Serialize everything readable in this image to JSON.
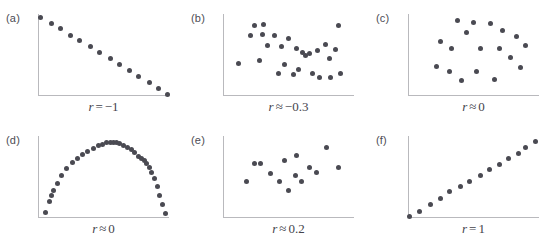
{
  "figure": {
    "type": "multi-panel-scatter",
    "background_color": "#ffffff",
    "dot_color": "#4a4a52",
    "axis_color": "#b9b9bd",
    "caption_color": "#44444c",
    "panel_count": 6,
    "columns": 3,
    "rows": 2
  },
  "chart_data": [
    {
      "type": "scatter",
      "panel": "a",
      "tag": "(a)",
      "title": "",
      "caption": "r = −1",
      "caption_symbol": "r",
      "caption_relation": "=",
      "caption_value": "−1",
      "xlabel": "",
      "ylabel": "",
      "xlim": [
        0,
        1
      ],
      "ylim": [
        0,
        1
      ],
      "grid": false,
      "legend": null,
      "n_points": 14,
      "x": [
        0.02,
        0.1,
        0.17,
        0.25,
        0.32,
        0.4,
        0.47,
        0.55,
        0.62,
        0.7,
        0.77,
        0.85,
        0.92,
        0.99
      ],
      "y": [
        0.96,
        0.89,
        0.82,
        0.74,
        0.68,
        0.6,
        0.53,
        0.46,
        0.39,
        0.31,
        0.24,
        0.17,
        0.09,
        0.02
      ]
    },
    {
      "type": "scatter",
      "panel": "b",
      "tag": "(b)",
      "title": "",
      "caption": "r ≈ −0.3",
      "caption_symbol": "r",
      "caption_relation": "≈",
      "caption_value": "−0.3",
      "xlabel": "",
      "ylabel": "",
      "xlim": [
        0,
        1
      ],
      "ylim": [
        0,
        1
      ],
      "grid": false,
      "legend": null,
      "n_points": 27,
      "x": [
        0.24,
        0.31,
        0.21,
        0.3,
        0.39,
        0.5,
        0.34,
        0.45,
        0.56,
        0.61,
        0.63,
        0.66,
        0.72,
        0.78,
        0.81,
        0.86,
        0.88,
        0.12,
        0.28,
        0.42,
        0.47,
        0.54,
        0.58,
        0.68,
        0.74,
        0.82,
        0.9
      ],
      "y": [
        0.86,
        0.87,
        0.74,
        0.75,
        0.74,
        0.7,
        0.62,
        0.6,
        0.58,
        0.53,
        0.5,
        0.52,
        0.55,
        0.63,
        0.46,
        0.57,
        0.86,
        0.4,
        0.43,
        0.28,
        0.38,
        0.26,
        0.32,
        0.27,
        0.22,
        0.23,
        0.28
      ]
    },
    {
      "type": "scatter",
      "panel": "c",
      "tag": "(c)",
      "title": "",
      "caption": "r ≈ 0",
      "caption_symbol": "r",
      "caption_relation": "≈",
      "caption_value": "0",
      "xlabel": "",
      "ylabel": "",
      "xlim": [
        0,
        1
      ],
      "ylim": [
        0,
        1
      ],
      "grid": false,
      "legend": null,
      "n_points": 18,
      "x": [
        0.38,
        0.5,
        0.63,
        0.72,
        0.45,
        0.83,
        0.25,
        0.9,
        0.33,
        0.55,
        0.7,
        0.78,
        0.22,
        0.32,
        0.52,
        0.86,
        0.41,
        0.66
      ],
      "y": [
        0.92,
        0.9,
        0.88,
        0.8,
        0.78,
        0.72,
        0.66,
        0.62,
        0.58,
        0.58,
        0.58,
        0.47,
        0.36,
        0.3,
        0.3,
        0.35,
        0.19,
        0.2
      ]
    },
    {
      "type": "scatter",
      "panel": "d",
      "tag": "(d)",
      "title": "",
      "caption": "r ≈ 0",
      "caption_symbol": "r",
      "caption_relation": "≈",
      "caption_value": "0",
      "xlabel": "",
      "ylabel": "",
      "xlim": [
        0,
        1
      ],
      "ylim": [
        0,
        1
      ],
      "grid": false,
      "legend": null,
      "shape": "semicircle-arch",
      "n_points": 34,
      "x": [
        0.06,
        0.09,
        0.1,
        0.12,
        0.15,
        0.18,
        0.22,
        0.26,
        0.3,
        0.34,
        0.38,
        0.42,
        0.46,
        0.49,
        0.52,
        0.55,
        0.58,
        0.6,
        0.62,
        0.65,
        0.68,
        0.71,
        0.74,
        0.77,
        0.79,
        0.81,
        0.83,
        0.85,
        0.87,
        0.89,
        0.91,
        0.93,
        0.95,
        0.97
      ],
      "y": [
        0.07,
        0.2,
        0.27,
        0.33,
        0.42,
        0.52,
        0.6,
        0.68,
        0.73,
        0.77,
        0.81,
        0.85,
        0.88,
        0.9,
        0.92,
        0.92,
        0.92,
        0.92,
        0.91,
        0.89,
        0.86,
        0.83,
        0.8,
        0.75,
        0.72,
        0.7,
        0.67,
        0.62,
        0.56,
        0.48,
        0.38,
        0.27,
        0.17,
        0.05
      ]
    },
    {
      "type": "scatter",
      "panel": "e",
      "tag": "(e)",
      "title": "",
      "caption": "r ≈ 0.2",
      "caption_symbol": "r",
      "caption_relation": "≈",
      "caption_value": "0.2",
      "xlabel": "",
      "ylabel": "",
      "xlim": [
        0,
        1
      ],
      "ylim": [
        0,
        1
      ],
      "grid": false,
      "legend": null,
      "n_points": 14,
      "x": [
        0.24,
        0.29,
        0.47,
        0.56,
        0.66,
        0.79,
        0.36,
        0.55,
        0.71,
        0.88,
        0.18,
        0.43,
        0.6,
        0.5
      ],
      "y": [
        0.66,
        0.66,
        0.7,
        0.76,
        0.62,
        0.86,
        0.54,
        0.52,
        0.56,
        0.62,
        0.44,
        0.44,
        0.44,
        0.33
      ]
    },
    {
      "type": "scatter",
      "panel": "f",
      "tag": "(f)",
      "title": "",
      "caption": "r = 1",
      "caption_symbol": "r",
      "caption_relation": "=",
      "caption_value": "1",
      "xlabel": "",
      "ylabel": "",
      "xlim": [
        0,
        1
      ],
      "ylim": [
        0,
        1
      ],
      "grid": false,
      "legend": null,
      "n_points": 14,
      "x": [
        0.01,
        0.09,
        0.17,
        0.25,
        0.32,
        0.4,
        0.47,
        0.55,
        0.62,
        0.7,
        0.77,
        0.84,
        0.9,
        0.97
      ],
      "y": [
        0.02,
        0.08,
        0.16,
        0.24,
        0.32,
        0.39,
        0.45,
        0.52,
        0.59,
        0.65,
        0.72,
        0.79,
        0.86,
        0.93
      ]
    }
  ]
}
